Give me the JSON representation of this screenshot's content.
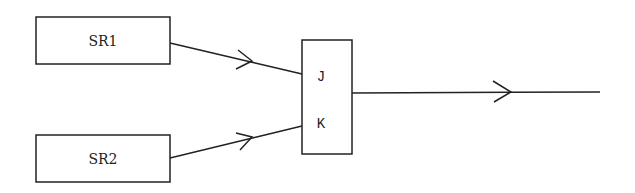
{
  "diagram": {
    "blocks": [
      {
        "id": "sr1",
        "label": "SR1"
      },
      {
        "id": "sr2",
        "label": "SR2"
      },
      {
        "id": "jk",
        "inputs": [
          "J",
          "K"
        ]
      }
    ],
    "edges": [
      {
        "from": "SR1",
        "to": "J"
      },
      {
        "from": "SR2",
        "to": "K"
      },
      {
        "from": "JK",
        "to": "output"
      }
    ],
    "colors": {
      "line": "#222222",
      "background": "#ffffff"
    }
  }
}
